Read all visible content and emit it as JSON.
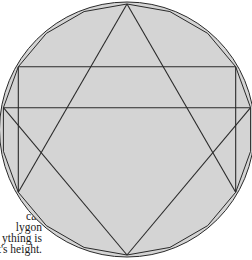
{
  "figure": {
    "fill_color": "#d4d4d4",
    "stroke_color": "#2a2a2a",
    "polygon_sides": 18,
    "chords": [
      {
        "from": 5,
        "to": 13
      },
      {
        "from": 6,
        "to": 12
      },
      {
        "from": 5,
        "to": 0
      },
      {
        "from": 13,
        "to": 0
      },
      {
        "from": 6,
        "to": 3
      },
      {
        "from": 12,
        "to": 15
      },
      {
        "from": 3,
        "to": 9
      },
      {
        "from": 15,
        "to": 9
      }
    ]
  },
  "caption": {
    "lines": [
      "s",
      "ter",
      "can",
      "lygon",
      "ything is",
      "rist's height."
    ]
  }
}
